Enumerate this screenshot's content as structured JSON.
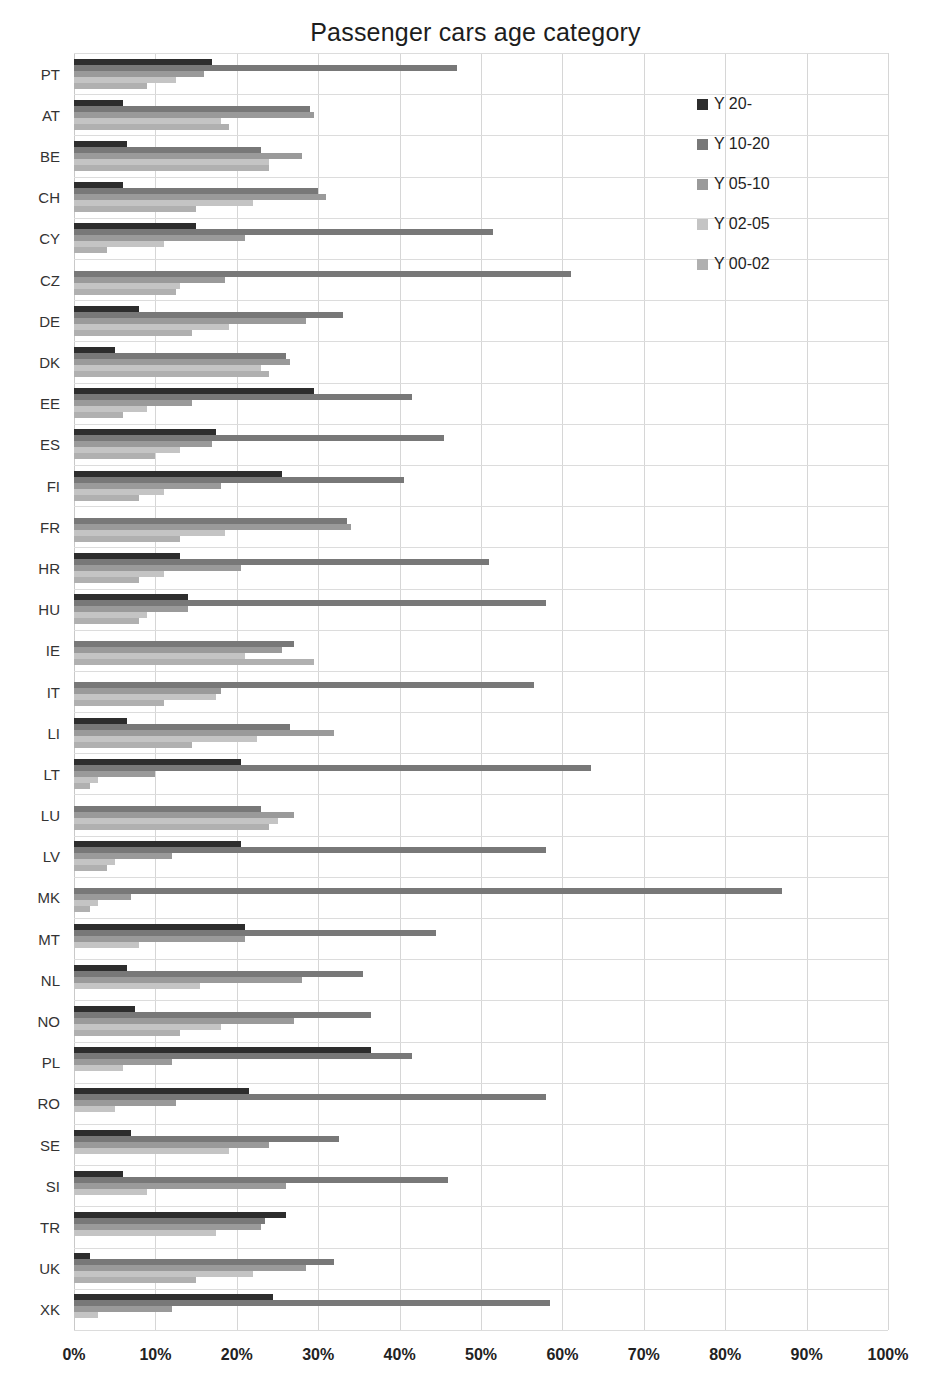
{
  "chart_data": {
    "type": "bar",
    "orientation": "horizontal",
    "title": "Passenger cars age category",
    "xlabel": "",
    "ylabel": "",
    "xlim": [
      0,
      100
    ],
    "xticks": [
      "0%",
      "10%",
      "20%",
      "30%",
      "40%",
      "50%",
      "60%",
      "70%",
      "80%",
      "90%",
      "100%"
    ],
    "xtick_values": [
      0,
      10,
      20,
      30,
      40,
      50,
      60,
      70,
      80,
      90,
      100
    ],
    "grid": true,
    "legend_position": "top-right",
    "categories": [
      "PT",
      "AT",
      "BE",
      "CH",
      "CY",
      "CZ",
      "DE",
      "DK",
      "EE",
      "ES",
      "FI",
      "FR",
      "HR",
      "HU",
      "IE",
      "IT",
      "LI",
      "LT",
      "LU",
      "LV",
      "MK",
      "MT",
      "NL",
      "NO",
      "PL",
      "RO",
      "SE",
      "SI",
      "TR",
      "UK",
      "XK"
    ],
    "series": [
      {
        "name": "Y 20-",
        "color": "#2d2d2d",
        "values": [
          17,
          6,
          6.5,
          6,
          15,
          0,
          8,
          5,
          29.5,
          17.5,
          25.5,
          0,
          13,
          14,
          0,
          0,
          6.5,
          20.5,
          0,
          20.5,
          0,
          21,
          6.5,
          7.5,
          36.5,
          21.5,
          7,
          6,
          26,
          2,
          24.5
        ]
      },
      {
        "name": "Y 10-20",
        "color": "#787878",
        "values": [
          47,
          29,
          23,
          30,
          51.5,
          61,
          33,
          26,
          41.5,
          45.5,
          40.5,
          33.5,
          51,
          58,
          27,
          56.5,
          26.5,
          63.5,
          23,
          58,
          87,
          44.5,
          35.5,
          36.5,
          41.5,
          58,
          32.5,
          46,
          23.5,
          32,
          58.5
        ]
      },
      {
        "name": "Y 05-10",
        "color": "#9a9a9a",
        "values": [
          16,
          29.5,
          28,
          31,
          21,
          18.5,
          28.5,
          26.5,
          14.5,
          17,
          18,
          34,
          20.5,
          14,
          25.5,
          18,
          32,
          10,
          27,
          12,
          7,
          21,
          28,
          27,
          12,
          12.5,
          24,
          26,
          23,
          28.5,
          12
        ]
      },
      {
        "name": "Y 02-05",
        "color": "#c4c4c4",
        "values": [
          12.5,
          18,
          24,
          22,
          11,
          13,
          19,
          23,
          9,
          13,
          11,
          18.5,
          11,
          9,
          21,
          17.5,
          22.5,
          3,
          25,
          5,
          3,
          8,
          15.5,
          18,
          6,
          5,
          19,
          9,
          17.5,
          22,
          3
        ]
      },
      {
        "name": "Y 00-02",
        "color": "#b0b0b0",
        "values": [
          9,
          19,
          24,
          15,
          4,
          12.5,
          14.5,
          24,
          6,
          10,
          8,
          13,
          8,
          8,
          29.5,
          11,
          14.5,
          2,
          24,
          4,
          2,
          0,
          0,
          13,
          0,
          0,
          0,
          0,
          0,
          15,
          0
        ]
      }
    ]
  },
  "legend": {
    "items": [
      {
        "label": "Y 20-"
      },
      {
        "label": "Y 10-20"
      },
      {
        "label": "Y 05-10"
      },
      {
        "label": "Y 02-05"
      },
      {
        "label": "Y 00-02"
      }
    ]
  }
}
